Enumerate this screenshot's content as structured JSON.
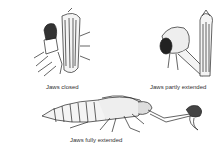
{
  "figures": [
    {
      "id": "closed",
      "caption": "Jaws closed"
    },
    {
      "id": "partly",
      "caption": "Jaws partly extended"
    },
    {
      "id": "fully",
      "caption": "Jaws fully extended"
    }
  ],
  "colors": {
    "ink": "#222222",
    "shade": "#555555",
    "paper": "#ffffff"
  }
}
